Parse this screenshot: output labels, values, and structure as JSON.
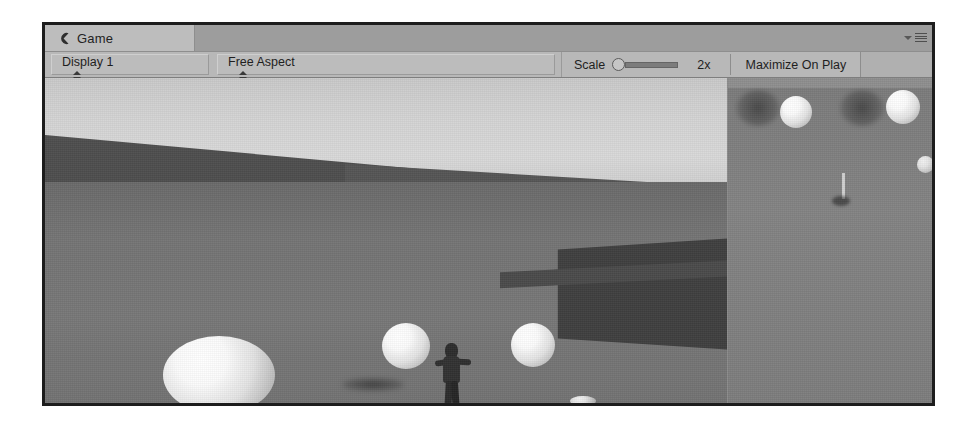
{
  "window": {
    "tab": {
      "label": "Game",
      "icon": "game-controller-icon"
    },
    "panel_menu": {
      "dropdown_icon": "chevron-down-icon",
      "menu_icon": "hamburger-menu-icon"
    }
  },
  "toolbar": {
    "display_dropdown": {
      "value": "Display 1",
      "arrows_icon": "updown-arrows-icon"
    },
    "aspect_dropdown": {
      "value": "Free Aspect",
      "arrows_icon": "updown-arrows-icon"
    },
    "scale": {
      "label": "Scale",
      "value": "2x",
      "slider_position_percent": 0
    },
    "maximize_on_play": {
      "label": "Maximize On Play"
    }
  },
  "scene": {
    "description": "Unity game view showing a grey terrain with white spheres, dark angled walls, a dark humanoid character and a secondary camera viewport on the right",
    "colors": {
      "sky": "#d4d4d4",
      "ground": "#767676",
      "wall": "#4a4a4a",
      "sphere": "#ffffff",
      "character": "#2c2c2c",
      "right_viewport_bg": "#808080"
    },
    "main_camera_objects": [
      {
        "name": "sphere-large-left",
        "x": 118,
        "y": 258,
        "w": 112,
        "h": 78,
        "kind": "sphere"
      },
      {
        "name": "sphere-mid-left",
        "x": 337,
        "y": 245,
        "w": 48,
        "h": 46,
        "kind": "sphere"
      },
      {
        "name": "sphere-mid-right",
        "x": 466,
        "y": 245,
        "w": 44,
        "h": 44,
        "kind": "sphere"
      },
      {
        "name": "shadow-large-left",
        "x": 20,
        "y": 358,
        "w": 132,
        "h": 30,
        "kind": "shadow"
      },
      {
        "name": "shadow-mid",
        "x": 297,
        "y": 300,
        "w": 62,
        "h": 13,
        "kind": "shadow"
      },
      {
        "name": "debris-ground",
        "x": 372,
        "y": 340,
        "w": 46,
        "h": 18,
        "kind": "shadow"
      },
      {
        "name": "ground-highlight",
        "x": 525,
        "y": 318,
        "w": 26,
        "h": 10,
        "kind": "sphere-dim"
      },
      {
        "name": "player-character",
        "x": 390,
        "y": 265,
        "w": 38,
        "h": 76,
        "kind": "character"
      }
    ],
    "right_camera_objects": [
      {
        "name": "sphere-top-a",
        "x": 52,
        "y": 18,
        "w": 32,
        "h": 32,
        "kind": "sphere"
      },
      {
        "name": "sphere-top-b",
        "x": 158,
        "y": 12,
        "w": 34,
        "h": 34,
        "kind": "sphere"
      },
      {
        "name": "sphere-small",
        "x": 189,
        "y": 78,
        "w": 17,
        "h": 17,
        "kind": "sphere-dim"
      },
      {
        "name": "blob-dark-a",
        "x": 8,
        "y": 12,
        "w": 44,
        "h": 36,
        "kind": "blob"
      },
      {
        "name": "blob-dark-b",
        "x": 112,
        "y": 12,
        "w": 44,
        "h": 36,
        "kind": "blob"
      },
      {
        "name": "pole-marker",
        "x": 114,
        "y": 95,
        "w": 3,
        "h": 26,
        "kind": "pole"
      },
      {
        "name": "pole-base",
        "x": 104,
        "y": 118,
        "w": 18,
        "h": 10,
        "kind": "pole-base"
      }
    ]
  }
}
